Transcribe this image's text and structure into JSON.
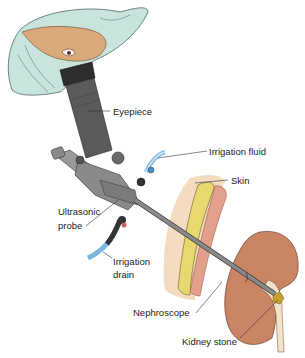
{
  "diagram": {
    "labels": {
      "eyepiece": "Eyepiece",
      "irrigation_fluid": "Irrigation fluid",
      "skin": "Skin",
      "ultrasonic_probe_line1": "Ultrasonic",
      "ultrasonic_probe_line2": "probe",
      "irrigation_drain_line1": "Irrigation",
      "irrigation_drain_line2": "drain",
      "nephroscope": "Nephroscope",
      "kidney_stone": "Kidney stone"
    },
    "colors": {
      "cap": "#c9e4dc",
      "skin_face": "#d9a97a",
      "scope_dark": "#5a5a5a",
      "scope_mid": "#8a8a8a",
      "tube_blue": "#7fb6e0",
      "skin_layer": "#f3dcc0",
      "fat": "#e8d870",
      "muscle": "#e2a08a",
      "kidney": "#c98464",
      "ureter": "#f3e3c8",
      "stone": "#c8a030"
    }
  }
}
